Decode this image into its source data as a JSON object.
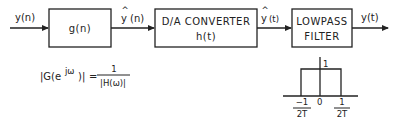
{
  "diagram": {
    "input_label": "y(n)",
    "blocks": [
      {
        "id": "g",
        "lines": [
          "g(n)"
        ]
      },
      {
        "id": "dac",
        "lines": [
          "D/A CONVERTER",
          "h(t)"
        ]
      },
      {
        "id": "lpf",
        "lines": [
          "LOWPASS",
          "FILTER"
        ]
      }
    ],
    "signals": {
      "after_g": {
        "base": "y",
        "hat": "^",
        "arg": "(n)"
      },
      "after_dac": {
        "base": "y",
        "hat": "^",
        "arg": "(t)"
      },
      "output": "y(t)"
    },
    "formula": {
      "lhs_open": "|G(e",
      "lhs_exp": "jω",
      "lhs_close": ")|",
      "equals": "=",
      "numerator": "1",
      "denominator": "|H(ω)|"
    },
    "filter_response": {
      "peak_label": "1",
      "origin_label": "0",
      "left_cutoff": {
        "num": "−1",
        "den": "2T"
      },
      "right_cutoff": {
        "num": "1",
        "den": "2T"
      }
    }
  }
}
